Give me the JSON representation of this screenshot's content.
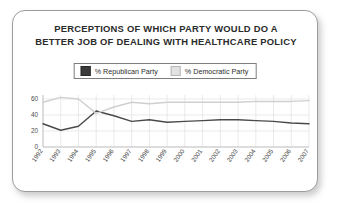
{
  "card": {
    "title_line_1": "PERCEPTIONS OF WHICH PARTY WOULD DO A",
    "title_line_2": "BETTER JOB OF DEALING WITH HEALTHCARE POLICY"
  },
  "colors": {
    "republican": "#4a4a4a",
    "democratic": "#cfcfcf",
    "card_border": "#9c9c9c",
    "grid": "#dcdcdc",
    "text": "#2b2b2b"
  },
  "chart_data": {
    "type": "line",
    "title": "PERCEPTIONS OF WHICH PARTY WOULD DO A BETTER JOB OF DEALING WITH HEALTHCARE POLICY",
    "xlabel": "",
    "ylabel": "",
    "ylim": [
      0,
      65
    ],
    "yticks": [
      0,
      20,
      40,
      60
    ],
    "ytick_labels": [
      "0",
      "20",
      "40",
      "60"
    ],
    "grid": true,
    "legend_position": "top-center",
    "categories": [
      "1992",
      "1993",
      "1994",
      "1995",
      "1996",
      "1997",
      "1998",
      "1999",
      "2000",
      "2001",
      "2002",
      "2003",
      "2004",
      "2005",
      "2006",
      "2007"
    ],
    "series": [
      {
        "name": "% Republican Party",
        "color": "#4a4a4a",
        "values": [
          29,
          21,
          26,
          45,
          39,
          32,
          34,
          31,
          32,
          33,
          34,
          34,
          33,
          32,
          30,
          29
        ]
      },
      {
        "name": "% Democratic Party",
        "color": "#cfcfcf",
        "values": [
          56,
          62,
          60,
          42,
          50,
          56,
          54,
          56,
          56,
          56,
          56,
          56,
          57,
          57,
          57,
          58
        ]
      }
    ],
    "legend": [
      {
        "label": "% Republican Party",
        "swatch": "#3a3a3a"
      },
      {
        "label": "% Democratic Party",
        "swatch": "#e2e2e2"
      }
    ]
  }
}
